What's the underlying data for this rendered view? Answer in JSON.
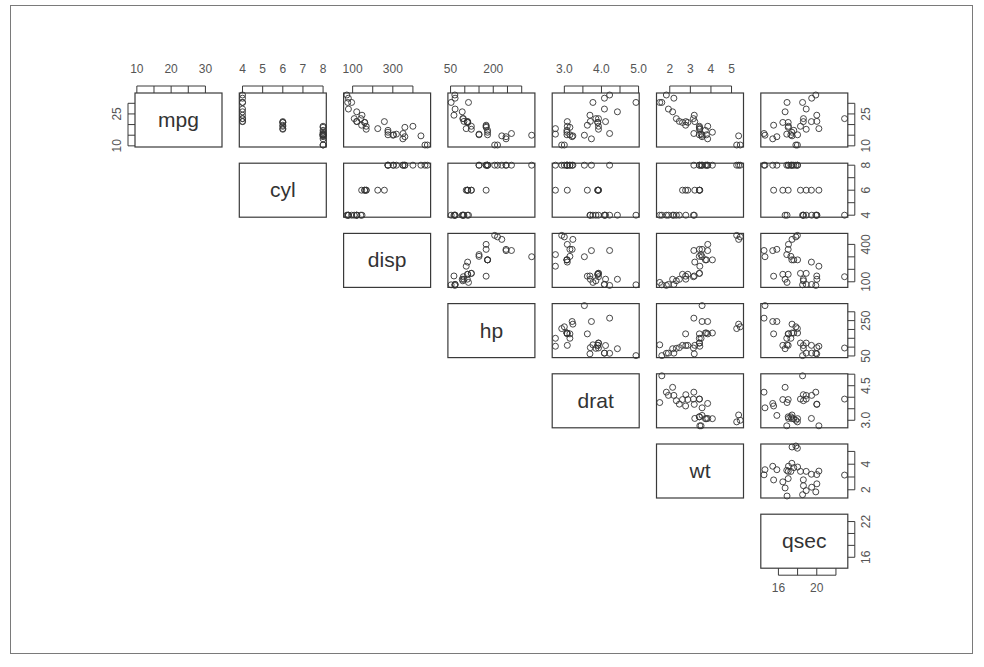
{
  "chart_data": {
    "type": "scatter",
    "subtype": "scatterplot-matrix-upper-triangle",
    "title": "",
    "variables": [
      "mpg",
      "cyl",
      "disp",
      "hp",
      "drat",
      "wt",
      "qsec"
    ],
    "axes": {
      "mpg": {
        "ticks": [
          10,
          15,
          20,
          25,
          30
        ],
        "labels_top": [
          "10",
          "20",
          "30"
        ],
        "labels_right": [
          "10",
          "25"
        ],
        "range": [
          10.4,
          33.9
        ]
      },
      "cyl": {
        "ticks": [
          4,
          5,
          6,
          7,
          8
        ],
        "labels_top": [
          "4",
          "5",
          "6",
          "7",
          "8"
        ],
        "labels_right": [
          "4",
          "6",
          "8"
        ],
        "range": [
          4,
          8
        ]
      },
      "disp": {
        "ticks": [
          100,
          200,
          300,
          400
        ],
        "labels_top": [
          "100",
          "300"
        ],
        "labels_right": [
          "100",
          "400"
        ],
        "range": [
          71.1,
          472
        ]
      },
      "hp": {
        "ticks": [
          50,
          100,
          150,
          200,
          250,
          300
        ],
        "labels_top": [
          "50",
          "200"
        ],
        "labels_right": [
          "50",
          "250"
        ],
        "range": [
          52,
          335
        ]
      },
      "drat": {
        "ticks": [
          3.0,
          3.5,
          4.0,
          4.5,
          5.0
        ],
        "labels_top": [
          "3.0",
          "4.0",
          "5.0"
        ],
        "labels_right": [
          "3.0",
          "4.5"
        ],
        "range": [
          2.76,
          4.93
        ]
      },
      "wt": {
        "ticks": [
          2,
          3,
          4,
          5
        ],
        "labels_top": [
          "2",
          "3",
          "4",
          "5"
        ],
        "labels_right": [
          "2",
          "4"
        ],
        "range": [
          1.513,
          5.424
        ]
      },
      "qsec": {
        "ticks": [
          16,
          18,
          20,
          22
        ],
        "labels_bottom": [
          "16",
          "20"
        ],
        "labels_right": [
          "16",
          "22"
        ],
        "range": [
          14.5,
          22.9
        ]
      }
    },
    "observations": {
      "mpg": [
        21.0,
        21.0,
        22.8,
        21.4,
        18.7,
        18.1,
        14.3,
        24.4,
        22.8,
        19.2,
        17.8,
        16.4,
        17.3,
        15.2,
        10.4,
        10.4,
        14.7,
        32.4,
        30.4,
        33.9,
        21.5,
        15.5,
        15.2,
        13.3,
        19.2,
        27.3,
        26.0,
        30.4,
        15.8,
        19.7,
        15.0,
        21.4
      ],
      "cyl": [
        6,
        6,
        4,
        6,
        8,
        6,
        8,
        4,
        4,
        6,
        6,
        8,
        8,
        8,
        8,
        8,
        8,
        4,
        4,
        4,
        4,
        8,
        8,
        8,
        8,
        4,
        4,
        4,
        8,
        6,
        8,
        4
      ],
      "disp": [
        160,
        160,
        108,
        258,
        360,
        225,
        360,
        146.7,
        140.8,
        167.6,
        167.6,
        275.8,
        275.8,
        275.8,
        472,
        460,
        440,
        78.7,
        75.7,
        71.1,
        120.1,
        318,
        304,
        350,
        400,
        79,
        120.3,
        95.1,
        351,
        145,
        301,
        121
      ],
      "hp": [
        110,
        110,
        93,
        110,
        175,
        105,
        245,
        62,
        95,
        123,
        123,
        180,
        180,
        180,
        205,
        215,
        230,
        66,
        52,
        65,
        97,
        150,
        150,
        245,
        175,
        66,
        91,
        113,
        264,
        175,
        335,
        109
      ],
      "drat": [
        3.9,
        3.9,
        3.85,
        3.08,
        3.15,
        2.76,
        3.21,
        3.69,
        3.92,
        3.92,
        3.92,
        3.07,
        3.07,
        3.07,
        2.93,
        3.0,
        3.23,
        4.08,
        4.93,
        4.22,
        3.7,
        2.76,
        3.15,
        3.73,
        3.08,
        4.08,
        4.43,
        3.77,
        4.22,
        3.62,
        3.54,
        4.11
      ],
      "wt": [
        2.62,
        2.875,
        2.32,
        3.215,
        3.44,
        3.46,
        3.57,
        3.19,
        3.15,
        3.44,
        3.44,
        4.07,
        3.73,
        3.78,
        5.25,
        5.424,
        5.345,
        2.2,
        1.615,
        1.835,
        2.465,
        3.52,
        3.435,
        3.84,
        3.845,
        1.935,
        2.14,
        1.513,
        3.17,
        2.77,
        3.57,
        2.78
      ],
      "qsec": [
        16.46,
        17.02,
        18.61,
        19.44,
        17.02,
        20.22,
        15.84,
        20.0,
        22.9,
        18.3,
        18.9,
        17.4,
        17.6,
        18.0,
        17.98,
        17.82,
        17.42,
        19.47,
        18.52,
        19.9,
        20.01,
        16.87,
        17.3,
        15.41,
        17.05,
        18.9,
        16.7,
        16.9,
        14.5,
        15.5,
        14.6,
        18.6
      ]
    },
    "layout": {
      "panels_shown": "diagonal and upper triangle",
      "top_axis_labels": true,
      "right_axis_labels": true,
      "bottom_axis_labels_on": "qsec",
      "left_axis_labels_on": "mpg",
      "grid": false,
      "marker": "open-circle"
    }
  }
}
